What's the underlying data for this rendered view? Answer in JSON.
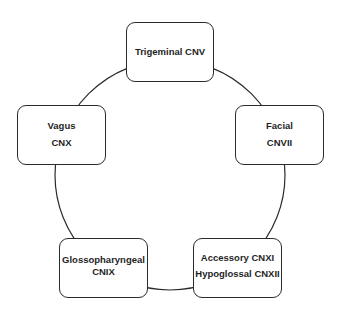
{
  "diagram": {
    "type": "cycle",
    "colors": {
      "stroke": "#2b2b2b",
      "text": "#1f1f1f",
      "background": "#ffffff"
    },
    "nodes": [
      {
        "id": "trigeminal",
        "lines": [
          "Trigeminal CNV"
        ]
      },
      {
        "id": "facial",
        "lines": [
          "Facial",
          "CNVII"
        ]
      },
      {
        "id": "accessory-hypoglossal",
        "lines": [
          "Accessory CNXI",
          "Hypoglossal CNXII"
        ]
      },
      {
        "id": "glossopharyngeal",
        "lines": [
          "Glossopharyngeal",
          "CNIX"
        ]
      },
      {
        "id": "vagus",
        "lines": [
          "Vagus",
          "CNX"
        ]
      }
    ],
    "connections": [
      [
        "trigeminal",
        "facial"
      ],
      [
        "facial",
        "accessory-hypoglossal"
      ],
      [
        "accessory-hypoglossal",
        "glossopharyngeal"
      ],
      [
        "glossopharyngeal",
        "vagus"
      ],
      [
        "vagus",
        "trigeminal"
      ]
    ]
  }
}
